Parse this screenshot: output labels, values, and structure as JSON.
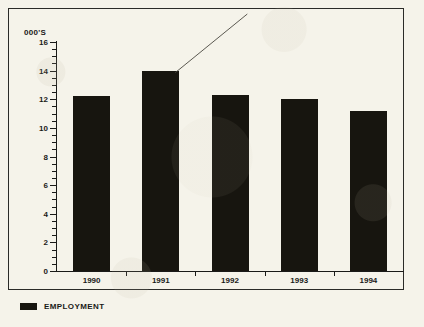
{
  "chart_data": {
    "type": "bar",
    "title": "",
    "subtitle": "",
    "xlabel": "",
    "ylabel": "000'S",
    "categories": [
      "1990",
      "1991",
      "1992",
      "1993",
      "1994"
    ],
    "values": [
      12.2,
      14.0,
      12.3,
      12.0,
      11.2
    ],
    "series": [
      {
        "name": "EMPLOYMENT",
        "values": [
          12.2,
          14.0,
          12.3,
          12.0,
          11.2
        ],
        "color": "#17150f"
      }
    ],
    "ylim": [
      0,
      16
    ],
    "y_major_step": 2,
    "y_minor_step": 0.5,
    "y_tick_labels": [
      "0",
      "2",
      "4",
      "6",
      "8",
      "10",
      "12",
      "14",
      "16"
    ],
    "x_tick_labels": [
      "1990",
      "1991",
      "1992",
      "1993",
      "1994"
    ],
    "grid": false,
    "legend_position": "bottom-left",
    "legend_entries": [
      {
        "label": "EMPLOYMENT",
        "color": "#17150f"
      }
    ],
    "annotations": [
      {
        "type": "leader-line",
        "label": "",
        "from_category": "1991",
        "from_value": 14.0
      }
    ],
    "background_color": "#f5f3ea",
    "axis_color": "#1a1a18"
  },
  "axis": {
    "unit_label": "000'S"
  },
  "legend": {
    "entries": [
      {
        "label": "EMPLOYMENT"
      }
    ]
  }
}
